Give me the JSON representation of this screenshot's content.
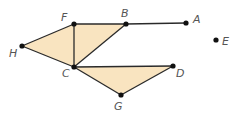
{
  "diagram": {
    "type": "graph",
    "colors": {
      "fill": "#f9e4c0",
      "edge": "#2a2a2a",
      "vertex": "#111111",
      "label": "#555555"
    },
    "vertices": [
      {
        "id": "A",
        "x": 186,
        "y": 23,
        "lx": 193,
        "ly": 23
      },
      {
        "id": "B",
        "x": 126,
        "y": 24,
        "lx": 121,
        "ly": 17
      },
      {
        "id": "C",
        "x": 74,
        "y": 67,
        "lx": 62,
        "ly": 77
      },
      {
        "id": "D",
        "x": 173,
        "y": 66,
        "lx": 176,
        "ly": 77
      },
      {
        "id": "E",
        "x": 216,
        "y": 40,
        "lx": 222,
        "ly": 45
      },
      {
        "id": "F",
        "x": 74,
        "y": 24,
        "lx": 61,
        "ly": 21
      },
      {
        "id": "G",
        "x": 121,
        "y": 95,
        "lx": 114,
        "ly": 110
      },
      {
        "id": "H",
        "x": 22,
        "y": 46,
        "lx": 9,
        "ly": 57
      }
    ],
    "edges": [
      [
        "F",
        "B"
      ],
      [
        "B",
        "A"
      ],
      [
        "H",
        "F"
      ],
      [
        "H",
        "C"
      ],
      [
        "F",
        "C"
      ],
      [
        "B",
        "C"
      ],
      [
        "C",
        "D"
      ],
      [
        "C",
        "G"
      ],
      [
        "G",
        "D"
      ]
    ],
    "shaded_triangles": [
      [
        "H",
        "F",
        "C"
      ],
      [
        "F",
        "B",
        "C"
      ],
      [
        "C",
        "D",
        "G"
      ]
    ]
  }
}
